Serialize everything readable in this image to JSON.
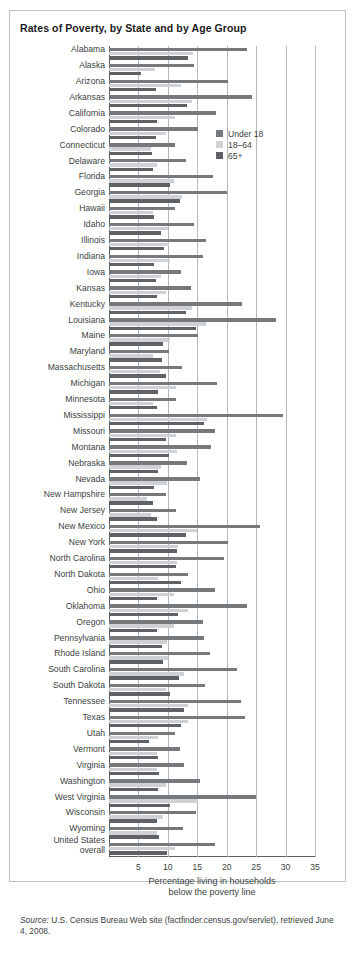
{
  "figure": {
    "title": "Rates of Poverty, by State and by Age Group",
    "source_word": "Source:",
    "source_text": " U.S. Census Bureau Web site (factfinder.census.gov/servlet), retrieved June 4, 2008."
  },
  "legend": {
    "position": "inside-right-top",
    "items": [
      {
        "label": "Under 18",
        "color": "#76797c",
        "key": "u18"
      },
      {
        "label": "18–64",
        "color": "#cfd2d4",
        "key": "a1864"
      },
      {
        "label": "65+",
        "color": "#5e6265",
        "key": "a65"
      }
    ]
  },
  "chart_data": {
    "type": "bar",
    "orientation": "horizontal",
    "title": "Rates of Poverty, by State and by Age Group",
    "xlabel": "Percentage living in households below the poverty line",
    "ylabel": "",
    "xlim": [
      0,
      35
    ],
    "xticks": [
      5,
      10,
      15,
      20,
      25,
      30,
      35
    ],
    "grid": "vertical",
    "legend_position": "inside-right-top",
    "categories": [
      "Alabama",
      "Alaska",
      "Arizona",
      "Arkansas",
      "California",
      "Colorado",
      "Connecticut",
      "Delaware",
      "Florida",
      "Georgia",
      "Hawaii",
      "Idaho",
      "Illinois",
      "Indiana",
      "Iowa",
      "Kansas",
      "Kentucky",
      "Louisiana",
      "Maine",
      "Maryland",
      "Massachusetts",
      "Michigan",
      "Minnesota",
      "Mississippi",
      "Missouri",
      "Montana",
      "Nebraska",
      "Nevada",
      "New Hampshire",
      "New Jersey",
      "New Mexico",
      "New York",
      "North Carolina",
      "North Dakota",
      "Ohio",
      "Oklahoma",
      "Oregon",
      "Pennsylvania",
      "Rhode Island",
      "South Carolina",
      "South Dakota",
      "Tennessee",
      "Texas",
      "Utah",
      "Vermont",
      "Virginia",
      "Washington",
      "West Virginia",
      "Wisconsin",
      "Wyoming",
      "United States overall"
    ],
    "series": [
      {
        "name": "Under 18",
        "color": "#76797c",
        "values": [
          23.4,
          14.5,
          20.2,
          24.3,
          18.1,
          15.1,
          11.2,
          13.0,
          17.6,
          20.1,
          11.2,
          14.4,
          16.4,
          16.0,
          12.3,
          14.0,
          22.6,
          28.3,
          15.1,
          10.2,
          12.4,
          18.3,
          11.4,
          29.5,
          18.0,
          17.3,
          13.3,
          15.4,
          9.6,
          11.4,
          25.6,
          20.3,
          19.5,
          13.4,
          18.0,
          23.5,
          16.0,
          16.1,
          17.1,
          21.7,
          16.3,
          22.4,
          23.1,
          11.2,
          12.0,
          12.8,
          15.4,
          25.0,
          14.7,
          12.5,
          18.0
        ]
      },
      {
        "name": "18–64",
        "color": "#cfd2d4",
        "values": [
          14.3,
          7.9,
          12.2,
          14.1,
          11.2,
          9.6,
          7.2,
          8.1,
          11.0,
          12.4,
          7.5,
          10.1,
          10.2,
          10.4,
          8.8,
          9.7,
          14.1,
          16.4,
          10.3,
          7.5,
          8.6,
          11.4,
          7.4,
          16.7,
          11.3,
          11.5,
          8.9,
          9.8,
          6.5,
          7.2,
          15.0,
          11.8,
          11.6,
          8.4,
          11.1,
          13.4,
          11.0,
          9.9,
          10.1,
          12.8,
          9.7,
          13.4,
          13.5,
          8.4,
          8.1,
          8.1,
          9.7,
          15.2,
          9.2,
          8.2,
          11.2
        ]
      },
      {
        "name": "65+",
        "color": "#5e6265",
        "values": [
          13.4,
          5.4,
          8.0,
          13.2,
          8.2,
          8.0,
          7.3,
          7.4,
          10.4,
          12.0,
          7.6,
          8.8,
          9.3,
          7.7,
          8.0,
          8.2,
          13.0,
          14.7,
          9.1,
          9.0,
          9.6,
          8.4,
          8.1,
          16.1,
          9.6,
          10.2,
          8.3,
          7.6,
          7.4,
          8.2,
          13.0,
          11.6,
          11.4,
          12.3,
          8.2,
          11.7,
          8.2,
          9.0,
          9.2,
          11.9,
          10.3,
          12.8,
          12.2,
          6.8,
          8.3,
          8.5,
          8.4,
          10.4,
          8.2,
          8.5,
          9.8
        ]
      }
    ]
  },
  "axis": {
    "tick_labels": [
      "5",
      "10",
      "15",
      "20",
      "25",
      "30",
      "35"
    ],
    "xlabel_line1": "Percentage living in households",
    "xlabel_line2": "below the poverty line"
  }
}
